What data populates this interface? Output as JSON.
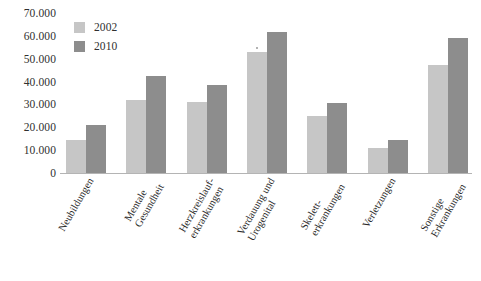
{
  "chart_data": {
    "type": "bar",
    "title": "",
    "subtitle": "",
    "xlabel": "",
    "ylabel": "",
    "ylim": [
      0,
      70000
    ],
    "grid": false,
    "legend_position": "top-left",
    "number_format": "de-DE (dot thousands separator)",
    "categories": [
      "Neubildungen",
      "Mentale Gesundheit",
      "Herzkreislauf-erkrankungen",
      "Verdauung und Urogenital",
      "Skelett-erkrankungen",
      "Verletzungen",
      "Sonstige Erkrankungen"
    ],
    "category_lines": [
      [
        "Neubildungen",
        ""
      ],
      [
        "Mentale",
        "Gesundheit"
      ],
      [
        "Herzkreislauf-",
        "erkrankungen"
      ],
      [
        "Verdauung und",
        "Urogenital"
      ],
      [
        "Skelett-",
        "erkrankungen"
      ],
      [
        "Verletzungen",
        ""
      ],
      [
        "Sonstige",
        "Erkrankungen"
      ]
    ],
    "series": [
      {
        "name": "2002",
        "color": "#c6c6c6",
        "values": [
          15000,
          32500,
          31500,
          53500,
          25500,
          11500,
          47500
        ]
      },
      {
        "name": "2010",
        "color": "#8d8d8d",
        "values": [
          21500,
          43000,
          39000,
          62000,
          31000,
          15000,
          59500
        ]
      }
    ],
    "y_ticks": [
      {
        "value": 70000,
        "label": "70.000"
      },
      {
        "value": 60000,
        "label": "60.000"
      },
      {
        "value": 50000,
        "label": "50.000"
      },
      {
        "value": 40000,
        "label": "40.000"
      },
      {
        "value": 30000,
        "label": "30.000"
      },
      {
        "value": 20000,
        "label": "20.000"
      },
      {
        "value": 10000,
        "label": "10.000"
      },
      {
        "value": 0,
        "label": "0"
      }
    ]
  },
  "legend": {
    "items": [
      {
        "label": "2002",
        "color": "#c6c6c6"
      },
      {
        "label": "2010",
        "color": "#8d8d8d"
      }
    ]
  }
}
